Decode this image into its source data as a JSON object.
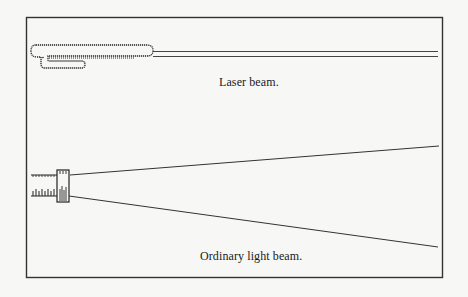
{
  "figure": {
    "colors": {
      "background": "#f7f7f5",
      "ink": "#222222",
      "frame": "#333333"
    },
    "panels": [
      {
        "id": "laser",
        "caption": "Laser beam.",
        "source_icon": "laser-device-icon",
        "beam_description": "two parallel lines (narrow, non-diverging beam)"
      },
      {
        "id": "ordinary",
        "caption": "Ordinary light beam.",
        "source_icon": "flashlight-icon",
        "beam_description": "two diverging lines (spreading beam)"
      }
    ]
  }
}
